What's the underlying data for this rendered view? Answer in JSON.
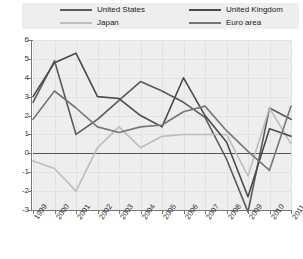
{
  "chart_data": {
    "type": "line",
    "title": "",
    "subtitle": "",
    "xlabel": "",
    "ylabel": "",
    "grid": true,
    "legend_position": "top",
    "x": [
      1999,
      2000,
      2001,
      2002,
      2003,
      2004,
      2005,
      2006,
      2007,
      2008,
      2009,
      2010,
      2011
    ],
    "categories": [
      "1999",
      "2000",
      "2001",
      "2002",
      "2003",
      "2004",
      "2005",
      "2006",
      "2007",
      "2008",
      "2009",
      "2010",
      "2011"
    ],
    "xlim": [
      1999,
      2011
    ],
    "ylim": [
      -3,
      6
    ],
    "ytick_labels": [
      "6",
      "5",
      "4",
      "3",
      "2",
      "1",
      "0",
      "-1",
      "-2",
      "-3"
    ],
    "yticks": [
      6,
      5,
      4,
      3,
      2,
      1,
      0,
      -1,
      -2,
      -3
    ],
    "series": [
      {
        "name": "United States",
        "color": "#5a5a5a",
        "values": [
          2.7,
          4.9,
          1.0,
          1.8,
          2.8,
          3.8,
          3.3,
          2.7,
          1.9,
          -0.3,
          -3.1,
          2.4,
          1.8
        ]
      },
      {
        "name": "Japan",
        "color": "#bdbdbd",
        "values": [
          -0.4,
          -0.8,
          -2.0,
          0.3,
          1.4,
          0.3,
          0.9,
          1.0,
          1.0,
          1.0,
          -1.2,
          2.4,
          0.5
        ]
      },
      {
        "name": "United Kingdom",
        "color": "#4a4a4a",
        "values": [
          3.0,
          4.8,
          5.3,
          3.0,
          2.9,
          2.0,
          1.4,
          4.0,
          2.0,
          0.6,
          -2.3,
          1.3,
          0.9
        ]
      },
      {
        "name": "Euro area",
        "color": "#777777",
        "values": [
          1.8,
          3.3,
          2.4,
          1.4,
          1.1,
          1.4,
          1.5,
          2.2,
          2.5,
          1.2,
          0.1,
          -0.9,
          2.5
        ]
      }
    ]
  },
  "legend": {
    "entries": [
      {
        "label": "United States",
        "color": "#5a5a5a"
      },
      {
        "label": "Japan",
        "color": "#bdbdbd"
      },
      {
        "label": "United Kingdom",
        "color": "#4a4a4a"
      },
      {
        "label": "Euro area",
        "color": "#777777"
      }
    ]
  },
  "colors": {
    "plot_background": "#eeeeee",
    "page_background": "#ffffff",
    "gridline": "#e2e2e2",
    "axis": "#777777",
    "zero_line": "#555555"
  }
}
